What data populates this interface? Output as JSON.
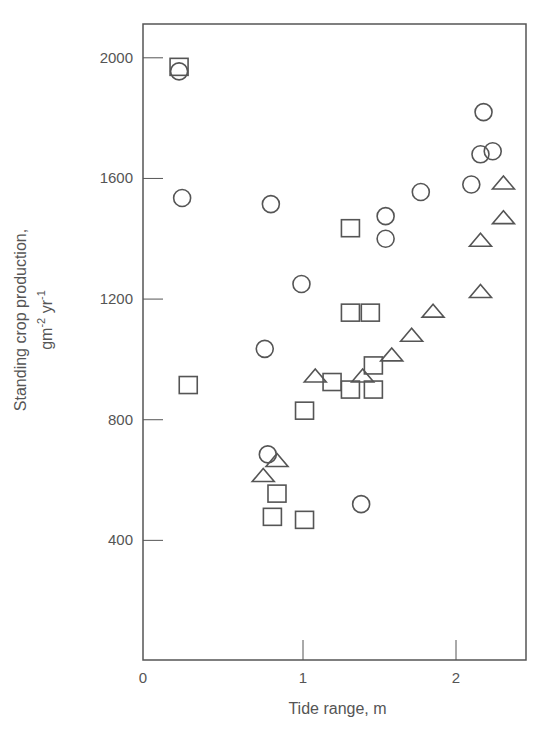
{
  "chart_data": {
    "type": "scatter",
    "title": "",
    "xlabel": "Tide range, m",
    "ylabel": "Standing crop production, gm^-2 yr^-1",
    "ylabel_line1": "Standing crop production,",
    "ylabel_line2_base": "gm",
    "ylabel_line2_exp1": "-2",
    "ylabel_line2_mid": " yr",
    "ylabel_line2_exp2": "-1",
    "xlim": [
      0,
      2.46
    ],
    "ylim": [
      0,
      2120
    ],
    "x_ticks": [
      0,
      1,
      2
    ],
    "x_tick_labels": [
      "0",
      "1",
      "2"
    ],
    "y_ticks": [
      400,
      800,
      1200,
      1600,
      2000
    ],
    "y_tick_labels": [
      "400",
      "800",
      "1200",
      "1600",
      "2000"
    ],
    "grid": false,
    "legend": null,
    "series": [
      {
        "name": "circles",
        "marker": "circle",
        "points": [
          {
            "x": 0.19,
            "y": 1955
          },
          {
            "x": 0.21,
            "y": 1535
          },
          {
            "x": 0.79,
            "y": 1515
          },
          {
            "x": 0.99,
            "y": 1250
          },
          {
            "x": 0.75,
            "y": 1035
          },
          {
            "x": 0.77,
            "y": 685
          },
          {
            "x": 1.38,
            "y": 520
          },
          {
            "x": 1.54,
            "y": 1475
          },
          {
            "x": 1.54,
            "y": 1400
          },
          {
            "x": 1.77,
            "y": 1555
          },
          {
            "x": 2.1,
            "y": 1580
          },
          {
            "x": 2.16,
            "y": 1680
          },
          {
            "x": 2.24,
            "y": 1690
          },
          {
            "x": 2.18,
            "y": 1820
          }
        ]
      },
      {
        "name": "squares",
        "marker": "square",
        "points": [
          {
            "x": 0.19,
            "y": 1970
          },
          {
            "x": 0.25,
            "y": 915
          },
          {
            "x": 0.8,
            "y": 478
          },
          {
            "x": 0.83,
            "y": 555
          },
          {
            "x": 1.01,
            "y": 468
          },
          {
            "x": 1.01,
            "y": 830
          },
          {
            "x": 1.19,
            "y": 925
          },
          {
            "x": 1.31,
            "y": 900
          },
          {
            "x": 1.46,
            "y": 900
          },
          {
            "x": 1.46,
            "y": 980
          },
          {
            "x": 1.31,
            "y": 1155
          },
          {
            "x": 1.44,
            "y": 1155
          },
          {
            "x": 1.31,
            "y": 1435
          }
        ]
      },
      {
        "name": "triangles",
        "marker": "triangle",
        "points": [
          {
            "x": 0.74,
            "y": 615
          },
          {
            "x": 0.83,
            "y": 665
          },
          {
            "x": 1.08,
            "y": 945
          },
          {
            "x": 1.39,
            "y": 945
          },
          {
            "x": 1.58,
            "y": 1015
          },
          {
            "x": 1.71,
            "y": 1080
          },
          {
            "x": 1.85,
            "y": 1160
          },
          {
            "x": 2.16,
            "y": 1225
          },
          {
            "x": 2.16,
            "y": 1395
          },
          {
            "x": 2.31,
            "y": 1470
          },
          {
            "x": 2.31,
            "y": 1585
          }
        ]
      }
    ],
    "colors": {
      "axis": "#555555",
      "marker": "#555555",
      "text": "#555555",
      "background": "#ffffff"
    }
  }
}
